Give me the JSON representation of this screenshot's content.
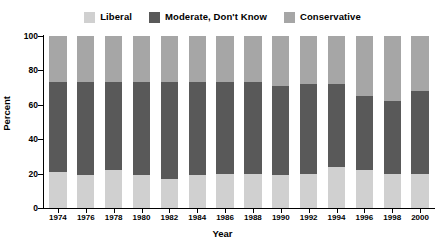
{
  "chart_data": {
    "type": "bar",
    "variant": "stacked-100-percent",
    "title": "",
    "xlabel": "Year",
    "ylabel": "Percent",
    "ylim": [
      0,
      100
    ],
    "yticks": [
      0,
      20,
      40,
      60,
      80,
      100
    ],
    "grid": false,
    "legend_position": "top-center",
    "categories": [
      "1974",
      "1976",
      "1978",
      "1980",
      "1982",
      "1984",
      "1986",
      "1988",
      "1990",
      "1992",
      "1994",
      "1996",
      "1998",
      "2000"
    ],
    "series": [
      {
        "name": "Liberal",
        "color": "#d0d0d0",
        "values": [
          21,
          19,
          22,
          19,
          17,
          19,
          20,
          20,
          19,
          20,
          24,
          22,
          20,
          20
        ]
      },
      {
        "name": "Moderate, Don't Know",
        "color": "#595959",
        "values": [
          52,
          54,
          51,
          54,
          56,
          54,
          53,
          53,
          52,
          52,
          48,
          43,
          42,
          48
        ]
      },
      {
        "name": "Conservative",
        "color": "#a6a6a6",
        "values": [
          27,
          27,
          27,
          27,
          27,
          27,
          27,
          27,
          29,
          28,
          28,
          35,
          38,
          32
        ]
      }
    ]
  },
  "legend": {
    "items": [
      {
        "label": "Liberal",
        "color": "#d0d0d0"
      },
      {
        "label": "Moderate, Don't Know",
        "color": "#595959"
      },
      {
        "label": "Conservative",
        "color": "#a6a6a6"
      }
    ]
  },
  "axes": {
    "y_title": "Percent",
    "x_title": "Year",
    "y_tick_labels": [
      "0",
      "20",
      "40",
      "60",
      "80",
      "100"
    ],
    "x_tick_labels": [
      "1974",
      "1976",
      "1978",
      "1980",
      "1982",
      "1984",
      "1986",
      "1988",
      "1990",
      "1992",
      "1994",
      "1996",
      "1998",
      "2000"
    ]
  },
  "colors": {
    "axis": "#000000",
    "background": "#ffffff",
    "liberal": "#d0d0d0",
    "moderate": "#595959",
    "conservative": "#a6a6a6"
  }
}
